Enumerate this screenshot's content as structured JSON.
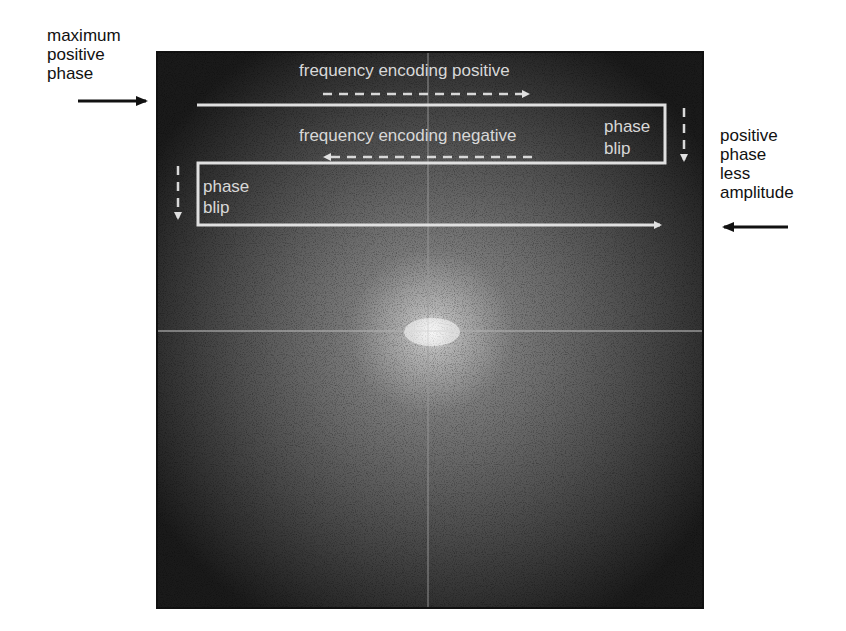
{
  "left_label": {
    "lines": [
      "maximum",
      "positive",
      "phase"
    ]
  },
  "right_label": {
    "lines": [
      "positive",
      "phase",
      "less",
      "amplitude"
    ]
  },
  "image": {
    "title": "k-space EPI trajectory",
    "labels": {
      "freq_pos": "frequency encoding positive",
      "freq_neg": "frequency encoding negative",
      "phase_blip_right_1": "phase",
      "phase_blip_right_2": "blip",
      "phase_blip_left_1": "phase",
      "phase_blip_left_2": "blip"
    }
  },
  "colors": {
    "trajectory": "#e0e0e0",
    "arrow": "#111111",
    "background": "#ffffff"
  }
}
